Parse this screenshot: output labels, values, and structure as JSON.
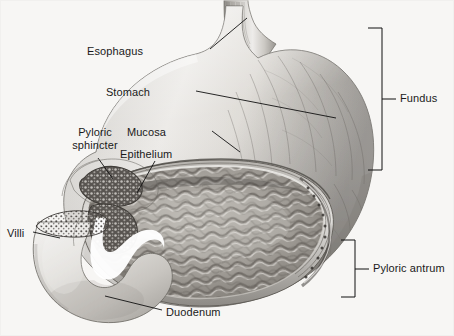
{
  "figure": {
    "width": 454,
    "height": 336,
    "background_color": "#f7f6f4",
    "ink_color": "#111111",
    "style": "grayscale pencil/airbrush medical illustration"
  },
  "labels": {
    "esophagus": "Esophagus",
    "stomach": "Stomach",
    "mucosa": "Mucosa",
    "epithelium": "Epithelium",
    "pyloric_sphincter_line1": "Pyloric",
    "pyloric_sphincter_line2": "sphincter",
    "villi": "Villi",
    "duodenum": "Duodenum",
    "fundus": "Fundus",
    "pyloric_antrum": "Pyloric antrum"
  },
  "callouts": [
    {
      "name": "esophagus",
      "text": "Esophagus",
      "text_x": 145,
      "text_y": 52,
      "anchor": "end",
      "leader": [
        [
          210,
          49
        ],
        [
          247,
          18
        ]
      ]
    },
    {
      "name": "stomach",
      "text": "Stomach",
      "text_x": 152,
      "text_y": 93,
      "anchor": "end",
      "leader": [
        [
          196,
          91
        ],
        [
          336,
          118
        ]
      ]
    },
    {
      "name": "mucosa",
      "text": "Mucosa",
      "text_x": 168,
      "text_y": 133,
      "anchor": "end",
      "leader": [
        [
          212,
          131
        ],
        [
          238,
          150
        ]
      ]
    },
    {
      "name": "epithelium",
      "text": "Epithelium",
      "text_x": 122,
      "text_y": 155,
      "anchor": "start",
      "leader": [
        [
          155,
          160
        ],
        [
          137,
          192
        ]
      ]
    },
    {
      "name": "pyloric-sphincter",
      "text": "Pyloric sphincter",
      "text_x": 62,
      "text_y": 133,
      "anchor": "start",
      "leader": [
        [
          98,
          158
        ],
        [
          112,
          178
        ]
      ]
    },
    {
      "name": "villi",
      "text": "Villi",
      "text_x": 8,
      "text_y": 234,
      "anchor": "start",
      "leader": [
        [
          33,
          231
        ],
        [
          59,
          237
        ]
      ]
    },
    {
      "name": "duodenum",
      "text": "Duodenum",
      "text_x": 166,
      "text_y": 313,
      "anchor": "start",
      "leader": [
        [
          162,
          310
        ],
        [
          106,
          296
        ]
      ]
    }
  ],
  "brackets": [
    {
      "name": "fundus",
      "text": "Fundus",
      "x": 382,
      "y_top": 28,
      "y_bottom": 170,
      "tick_y": 99,
      "arm": 14,
      "label_x": 405,
      "label_y": 99
    },
    {
      "name": "pyloric-antrum",
      "text": "Pyloric antrum",
      "x": 355,
      "y_top": 240,
      "y_bottom": 297,
      "tick_y": 269,
      "arm": 14,
      "label_x": 378,
      "label_y": 269
    }
  ]
}
